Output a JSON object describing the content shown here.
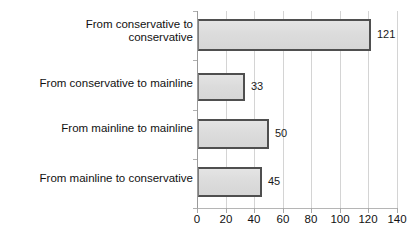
{
  "chart_data": {
    "type": "bar",
    "orientation": "horizontal",
    "title": "",
    "xlabel": "",
    "ylabel": "",
    "categories": [
      "From conservative to conservative",
      "From conservative to mainline",
      "From mainline to mainline",
      "From mainline to conservative"
    ],
    "values": [
      121,
      33,
      50,
      45
    ],
    "value_labels": [
      "121",
      "33",
      "50",
      "45"
    ],
    "xlim": [
      0,
      140
    ],
    "xticks": [
      0,
      20,
      40,
      60,
      80,
      100,
      120,
      140
    ],
    "xtick_labels": [
      "0",
      "20",
      "40",
      "60",
      "80",
      "100",
      "120",
      "140"
    ],
    "grid": "vertical",
    "legend": "none",
    "series": [
      {
        "name": "Count",
        "values": [
          121,
          33,
          50,
          45
        ]
      }
    ]
  },
  "category_lines": [
    [
      "From conservative to",
      "conservative"
    ],
    [
      "From conservative to mainline"
    ],
    [
      "From mainline to mainline"
    ],
    [
      "From mainline to conservative"
    ]
  ],
  "colors": {
    "bar_fill": "#dcdcdc",
    "bar_border": "#4f4f4f",
    "gridline": "#d4d4d4",
    "axis": "#9a9a9a",
    "text": "#111111",
    "background": "#ffffff"
  },
  "geometry": {
    "plot_left": 197,
    "plot_top": 11,
    "plot_width": 200,
    "plot_height": 197,
    "px_per_unit": 1.4286,
    "bars": [
      {
        "top": 8,
        "height": 32
      },
      {
        "top": 62,
        "height": 28
      },
      {
        "top": 108,
        "height": 30
      },
      {
        "top": 156,
        "height": 30
      }
    ],
    "category_label_tops": [
      18,
      77,
      122,
      172
    ]
  }
}
